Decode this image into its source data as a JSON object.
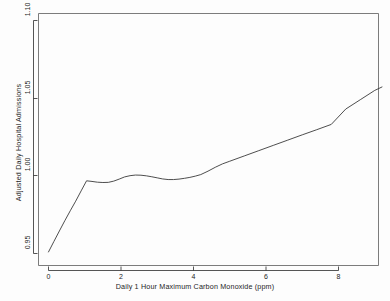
{
  "chart_data": {
    "type": "line",
    "title": "",
    "subtitle": "",
    "xlabel": "Daily 1 Hour Maximum Carbon Monoxide (ppm)",
    "ylabel": "Adjusted Daily Hospital Admissions",
    "xlim": [
      -0.25,
      9.3
    ],
    "ylim": [
      0.95,
      1.105
    ],
    "xticks": [
      0,
      2,
      4,
      6,
      8
    ],
    "xtick_labels": [
      "0",
      "2",
      "4",
      "6",
      "8"
    ],
    "yticks": [
      0.95,
      1.0,
      1.05,
      1.1
    ],
    "ytick_labels": [
      "0.95",
      "1.00",
      "1.05",
      "1.10"
    ],
    "grid": false,
    "legend": false,
    "legend_position": "none",
    "line_color": "#3a3a3a",
    "line_width": 0.9,
    "series": [
      {
        "name": "Adjusted admissions vs CO",
        "x": [
          0.0,
          0.15,
          0.3,
          0.45,
          0.6,
          0.75,
          0.9,
          1.05,
          1.2,
          1.35,
          1.5,
          1.65,
          1.8,
          1.95,
          2.1,
          2.25,
          2.4,
          2.55,
          2.7,
          2.85,
          3.0,
          3.15,
          3.3,
          3.45,
          3.6,
          3.75,
          3.9,
          4.05,
          4.2,
          4.4,
          4.6,
          4.8,
          5.0,
          5.4,
          5.8,
          6.2,
          6.6,
          7.0,
          7.4,
          7.8,
          8.2,
          8.6,
          9.0,
          9.2
        ],
        "y": [
          0.951,
          0.9578,
          0.9645,
          0.9711,
          0.9775,
          0.9837,
          0.9903,
          0.9968,
          0.9964,
          0.9959,
          0.9957,
          0.9958,
          0.9966,
          0.9979,
          0.9993,
          1.0001,
          1.0005,
          1.0004,
          1.0,
          0.9994,
          0.9987,
          0.998,
          0.9976,
          0.9976,
          0.9979,
          0.9984,
          0.999,
          0.9998,
          1.0008,
          1.003,
          1.0055,
          1.0077,
          1.0094,
          1.0128,
          1.0162,
          1.0196,
          1.023,
          1.0264,
          1.0297,
          1.0331,
          1.043,
          1.049,
          1.055,
          1.0572
        ]
      }
    ]
  },
  "axes": {
    "x_title": "Daily 1 Hour Maximum Carbon Monoxide (ppm)",
    "y_title": "Adjusted Daily Hospital Admissions",
    "x_tick_0": "0",
    "x_tick_1": "2",
    "x_tick_2": "4",
    "x_tick_3": "6",
    "x_tick_4": "8",
    "y_tick_0": "0.95",
    "y_tick_1": "1.00",
    "y_tick_2": "1.05",
    "y_tick_3": "1.10"
  }
}
